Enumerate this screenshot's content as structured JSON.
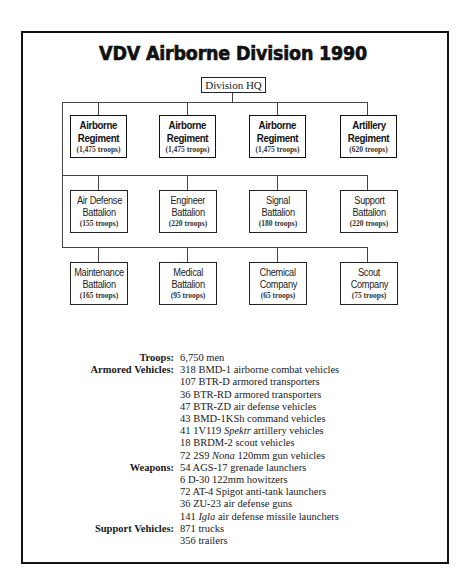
{
  "title": "VDV Airborne Division 1990",
  "hq": {
    "label": "Division HQ"
  },
  "rows": [
    {
      "units": [
        {
          "line1": "Airborne",
          "line2": "Regiment",
          "troops": "(1,475 troops)"
        },
        {
          "line1": "Airborne",
          "line2": "Regiment",
          "troops": "(1,475 troops)"
        },
        {
          "line1": "Airborne",
          "line2": "Regiment",
          "troops": "(1,475 troops)"
        },
        {
          "line1": "Artillery",
          "line2": "Regiment",
          "troops": "(620 troops)"
        }
      ]
    },
    {
      "units": [
        {
          "line1": "Air Defense",
          "line2": "Battalion",
          "troops": "(155 troops)"
        },
        {
          "line1": "Engineer",
          "line2": "Battalion",
          "troops": "(220 troops)"
        },
        {
          "line1": "Signal",
          "line2": "Battalion",
          "troops": "(180 troops)"
        },
        {
          "line1": "Support",
          "line2": "Battalion",
          "troops": "(220 troops)"
        }
      ]
    },
    {
      "units": [
        {
          "line1": "Maintenance",
          "line2": "Battalion",
          "troops": "(165 troops)"
        },
        {
          "line1": "Medical",
          "line2": "Battalion",
          "troops": "(95 troops)"
        },
        {
          "line1": "Chemical",
          "line2": "Company",
          "troops": "(65 troops)"
        },
        {
          "line1": "Scout",
          "line2": "Company",
          "troops": "(75 troops)"
        }
      ]
    }
  ],
  "stats": {
    "troops": {
      "label": "Troops:",
      "items": [
        "6,750 men"
      ]
    },
    "armored_vehicles": {
      "label": "Armored Vehicles:",
      "items": [
        "318 BMD-1 airborne combat vehicles",
        "107 BTR-D armored transporters",
        "36 BTR-RD armored transporters",
        "47 BTR-ZD air defense vehicles",
        "43 BMD-1KSh command vehicles",
        {
          "pre": "41 1V119 ",
          "em": "Spektr",
          "post": " artillery vehicles"
        },
        "18 BRDM-2 scout vehicles",
        {
          "pre": "72 2S9 ",
          "em": "Nona",
          "post": " 120mm gun vehicles"
        }
      ]
    },
    "weapons": {
      "label": "Weapons:",
      "items": [
        "54 AGS-17 grenade launchers",
        "6 D-30 122mm howitzers",
        "72 AT-4 Spigot anti-tank launchers",
        "36 ZU-23 air defense guns",
        {
          "pre": "141 ",
          "em": "Igla",
          "post": " air defense missile launchers"
        }
      ]
    },
    "support_vehicles": {
      "label": "Support Vehicles:",
      "items": [
        "871 trucks",
        "356 trailers"
      ]
    }
  }
}
